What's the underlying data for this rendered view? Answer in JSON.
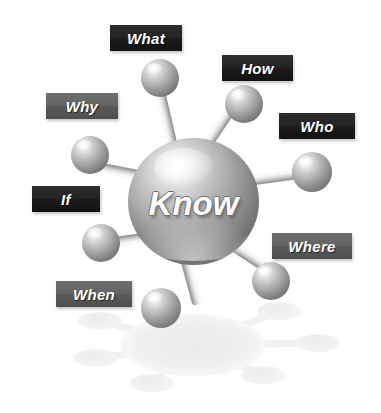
{
  "diagram": {
    "title": "Know",
    "center": {
      "label": "Know",
      "x": 128,
      "y": 138,
      "w": 131,
      "h": 127
    },
    "colors": {
      "background": "#ffffff",
      "label_dark": "#1b1b1b",
      "label_mid": "#5a5a5a",
      "label_text": "#ffffff",
      "sphere_light": "#ffffff",
      "sphere_mid": "#a6a6a6",
      "sphere_dark": "#6d6d6d",
      "rod": "#d2d2d2",
      "reflection": "#e4e4e4"
    },
    "nodes": [
      {
        "label": "What",
        "tone": "dark",
        "label_box": {
          "x": 110,
          "y": 25,
          "w": 72,
          "h": 26
        },
        "sphere": {
          "x": 141,
          "y": 59,
          "w": 38,
          "h": 38
        },
        "rod": {
          "x": 176,
          "y": 158,
          "length": 85,
          "angle": -103,
          "thickness": 9
        }
      },
      {
        "label": "How",
        "tone": "dark",
        "label_box": {
          "x": 222,
          "y": 55,
          "w": 71,
          "h": 26
        },
        "sphere": {
          "x": 225,
          "y": 85,
          "w": 38,
          "h": 38
        },
        "rod": {
          "x": 202,
          "y": 153,
          "length": 62,
          "angle": -56,
          "thickness": 9
        }
      },
      {
        "label": "Who",
        "tone": "dark",
        "label_box": {
          "x": 279,
          "y": 113,
          "w": 76,
          "h": 26
        },
        "sphere": {
          "x": 292,
          "y": 152,
          "w": 40,
          "h": 40
        },
        "rod": {
          "x": 233,
          "y": 183,
          "length": 68,
          "angle": -8,
          "thickness": 9
        }
      },
      {
        "label": "Where",
        "tone": "mid",
        "label_box": {
          "x": 272,
          "y": 233,
          "w": 80,
          "h": 26
        },
        "sphere": {
          "x": 252,
          "y": 262,
          "w": 38,
          "h": 38
        },
        "rod": {
          "x": 222,
          "y": 239,
          "length": 52,
          "angle": 33,
          "thickness": 9
        }
      },
      {
        "label": "When",
        "tone": "mid",
        "label_box": {
          "x": 56,
          "y": 281,
          "w": 76,
          "h": 26
        },
        "sphere": {
          "x": 141,
          "y": 288,
          "w": 40,
          "h": 40
        },
        "rod": {
          "x": 182,
          "y": 248,
          "length": 58,
          "angle": 75,
          "thickness": 9
        }
      },
      {
        "label": "If",
        "tone": "dark",
        "label_box": {
          "x": 32,
          "y": 186,
          "w": 68,
          "h": 26
        },
        "sphere": {
          "x": 82,
          "y": 224,
          "w": 38,
          "h": 38
        },
        "rod": {
          "x": 150,
          "y": 236,
          "length": 58,
          "angle": 172,
          "thickness": 9
        }
      },
      {
        "label": "Why",
        "tone": "mid",
        "label_box": {
          "x": 46,
          "y": 93,
          "w": 72,
          "h": 26
        },
        "sphere": {
          "x": 71,
          "y": 136,
          "w": 38,
          "h": 38
        },
        "rod": {
          "x": 148,
          "y": 176,
          "length": 62,
          "angle": 191,
          "thickness": 9
        }
      }
    ],
    "reflection": {
      "hub": {
        "cx": 193,
        "cy": 345,
        "rx": 72,
        "ry": 31
      },
      "nodes": [
        {
          "cx": 100,
          "cy": 321,
          "rx": 22,
          "ry": 9
        },
        {
          "cx": 279,
          "cy": 311,
          "rx": 22,
          "ry": 9
        },
        {
          "cx": 318,
          "cy": 343,
          "rx": 22,
          "ry": 9
        },
        {
          "cx": 263,
          "cy": 375,
          "rx": 22,
          "ry": 9
        },
        {
          "cx": 152,
          "cy": 383,
          "rx": 22,
          "ry": 9
        },
        {
          "cx": 96,
          "cy": 358,
          "rx": 22,
          "ry": 9
        }
      ]
    }
  }
}
